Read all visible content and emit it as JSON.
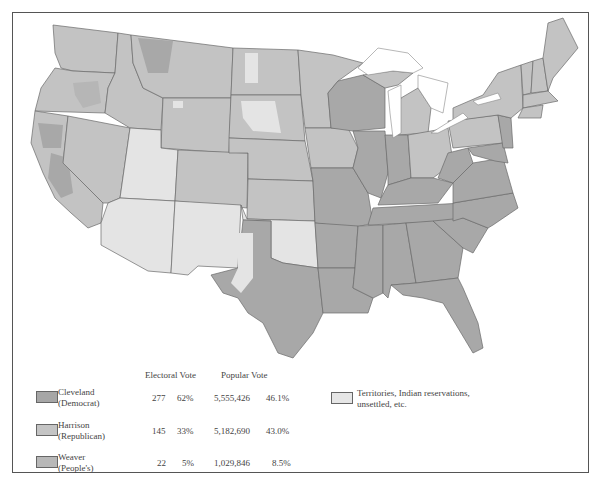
{
  "legend": {
    "headers": {
      "electoral": "Electoral Vote",
      "popular": "Popular Vote"
    },
    "candidates": [
      {
        "name": "Cleveland",
        "party": "(Democrat)",
        "electoral_votes": "277",
        "electoral_pct": "62%",
        "popular_votes": "5,555,426",
        "popular_pct": "46.1%",
        "color": "#a6a6a6"
      },
      {
        "name": "Harrison",
        "party": "(Republican)",
        "electoral_votes": "145",
        "electoral_pct": "33%",
        "popular_votes": "5,182,690",
        "popular_pct": "43.0%",
        "color": "#c4c4c4"
      },
      {
        "name": "Weaver",
        "party": "(People's)",
        "electoral_votes": "22",
        "electoral_pct": "5%",
        "popular_votes": "1,029,846",
        "popular_pct": "8.5%",
        "color": "#b8b8b8"
      }
    ],
    "territories": {
      "line1": "Territories, Indian reservations,",
      "line2": "unsettled, etc.",
      "color": "#e6e6e6"
    }
  },
  "colors": {
    "democrat": "#a8a8a8",
    "republican": "#c3c3c3",
    "peoples": "#b6b6b6",
    "territory": "#e4e4e4",
    "border": "#6a6a6a",
    "water": "#ffffff"
  }
}
